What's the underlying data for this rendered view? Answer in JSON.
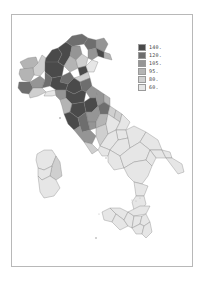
{
  "map": {
    "subject": "Italy provinces choropleth",
    "colors": {
      "c140": "#4a4a4a",
      "c120": "#6e6e6e",
      "c105": "#959595",
      "c95": "#b4b4b4",
      "c80": "#cfcfcf",
      "c60": "#e6e6e6",
      "frame": "#b8b8b8",
      "background": "#ffffff"
    }
  },
  "legend": {
    "items": [
      {
        "label": "140.",
        "color": "#4a4a4a"
      },
      {
        "label": "120.",
        "color": "#6e6e6e"
      },
      {
        "label": "105.",
        "color": "#959595"
      },
      {
        "label": "95.",
        "color": "#b4b4b4"
      },
      {
        "label": "80.",
        "color": "#cfcfcf"
      },
      {
        "label": "60.",
        "color": "#e6e6e6"
      }
    ]
  }
}
